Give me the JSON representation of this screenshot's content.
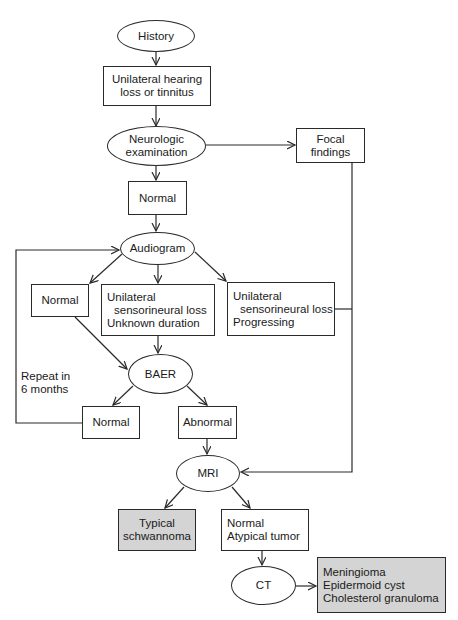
{
  "diagram": {
    "type": "flowchart",
    "nodes": {
      "history": {
        "shape": "ellipse",
        "lines": [
          "History"
        ]
      },
      "hearing_loss": {
        "shape": "box",
        "lines": [
          "Unilateral hearing",
          "loss or tinnitus"
        ]
      },
      "neuro_exam": {
        "shape": "ellipse",
        "lines": [
          "Neurologic",
          "examination"
        ]
      },
      "focal_findings": {
        "shape": "box",
        "lines": [
          "Focal",
          "findings"
        ]
      },
      "neuro_normal": {
        "shape": "box",
        "lines": [
          "Normal"
        ]
      },
      "audiogram": {
        "shape": "ellipse",
        "lines": [
          "Audiogram"
        ]
      },
      "audio_normal": {
        "shape": "box",
        "lines": [
          "Normal"
        ]
      },
      "unknown_duration": {
        "shape": "box",
        "lines": [
          "Unilateral",
          "sensorineural loss",
          "Unknown duration"
        ]
      },
      "progressing": {
        "shape": "box",
        "lines": [
          "Unilateral",
          "sensorineural loss",
          "Progressing"
        ]
      },
      "baer": {
        "shape": "ellipse",
        "lines": [
          "BAER"
        ]
      },
      "baer_normal": {
        "shape": "box",
        "lines": [
          "Normal"
        ]
      },
      "baer_abnormal": {
        "shape": "box",
        "lines": [
          "Abnormal"
        ]
      },
      "mri": {
        "shape": "ellipse",
        "lines": [
          "MRI"
        ]
      },
      "schwannoma": {
        "shape": "box",
        "shaded": true,
        "lines": [
          "Typical",
          "schwannoma"
        ]
      },
      "atypical": {
        "shape": "box",
        "lines": [
          "Normal",
          "Atypical tumor"
        ]
      },
      "ct": {
        "shape": "ellipse",
        "lines": [
          "CT"
        ]
      },
      "ct_results": {
        "shape": "box",
        "shaded": true,
        "lines": [
          "Meningioma",
          "Epidermoid cyst",
          "Cholesterol granuloma"
        ]
      }
    },
    "edges": [
      {
        "from": "history",
        "to": "hearing_loss"
      },
      {
        "from": "hearing_loss",
        "to": "neuro_exam"
      },
      {
        "from": "neuro_exam",
        "to": "focal_findings"
      },
      {
        "from": "neuro_exam",
        "to": "neuro_normal"
      },
      {
        "from": "neuro_normal",
        "to": "audiogram"
      },
      {
        "from": "audiogram",
        "to": "audio_normal"
      },
      {
        "from": "audiogram",
        "to": "unknown_duration"
      },
      {
        "from": "audiogram",
        "to": "progressing"
      },
      {
        "from": "audio_normal",
        "to": "baer"
      },
      {
        "from": "unknown_duration",
        "to": "baer"
      },
      {
        "from": "baer",
        "to": "baer_normal"
      },
      {
        "from": "baer",
        "to": "baer_abnormal"
      },
      {
        "from": "baer_normal",
        "to": "audiogram",
        "label": "Repeat in 6 months"
      },
      {
        "from": "baer_abnormal",
        "to": "mri"
      },
      {
        "from": "focal_findings",
        "to": "mri"
      },
      {
        "from": "progressing",
        "to": "mri"
      },
      {
        "from": "mri",
        "to": "schwannoma"
      },
      {
        "from": "mri",
        "to": "atypical"
      },
      {
        "from": "atypical",
        "to": "ct"
      },
      {
        "from": "ct",
        "to": "ct_results"
      }
    ],
    "loop_label": {
      "line1": "Repeat in",
      "line2": "6 months"
    }
  },
  "colors": {
    "stroke": "#2a2a2a",
    "shaded_fill": "#d4d4d4",
    "background": "#ffffff"
  }
}
